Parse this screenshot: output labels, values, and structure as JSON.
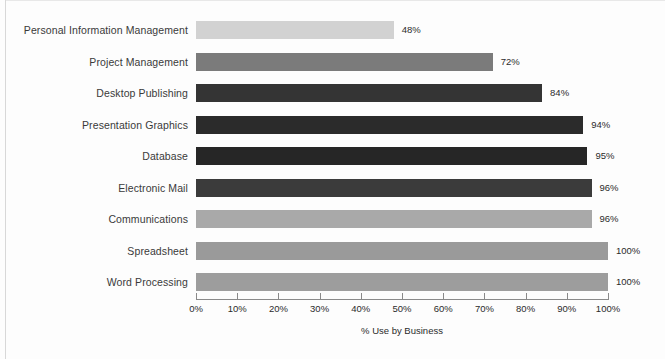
{
  "chart_data": {
    "type": "bar",
    "orientation": "horizontal",
    "title": "",
    "xlabel": "% Use by Business",
    "ylabel": "",
    "xlim": [
      0,
      100
    ],
    "grid": false,
    "legend": null,
    "x_ticks": [
      "0%",
      "10%",
      "20%",
      "30%",
      "40%",
      "50%",
      "60%",
      "70%",
      "80%",
      "90%",
      "100%"
    ],
    "x_tick_values": [
      0,
      10,
      20,
      30,
      40,
      50,
      60,
      70,
      80,
      90,
      100
    ],
    "categories": [
      "Personal Information Management",
      "Project Management",
      "Desktop Publishing",
      "Presentation Graphics",
      "Database",
      "Electronic Mail",
      "Communications",
      "Spreadsheet",
      "Word Processing"
    ],
    "values": [
      48,
      72,
      84,
      94,
      95,
      96,
      96,
      100,
      100
    ],
    "value_labels": [
      "48%",
      "72%",
      "84%",
      "94%",
      "95%",
      "96%",
      "96%",
      "100%",
      "100%"
    ],
    "bar_colors": [
      "#d2d2d2",
      "#7b7b7b",
      "#343434",
      "#2b2b2b",
      "#262626",
      "#3b3b3b",
      "#a9a9a9",
      "#9a9a9a",
      "#9d9d9d"
    ]
  },
  "style": {
    "background": "#fdfdfd",
    "axis_color": "#8a8a8a",
    "text_color": "#2b2b2b",
    "label_color": "#3a3a3a"
  }
}
